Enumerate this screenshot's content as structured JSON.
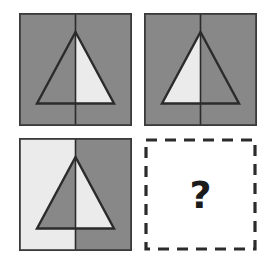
{
  "puzzle": {
    "type": "visual-analogy-matrix",
    "rows": 2,
    "columns": 2,
    "canvas_background": "#ffffff",
    "colors": {
      "gray": "#888888",
      "light": "#ebebeb",
      "outline": "#2b2b2b",
      "dash": "#2b2b2b",
      "question_mark": "#1a1a1a"
    },
    "geometry": {
      "panel_size": 113,
      "apex_x_pct": 50,
      "apex_y_pct": 17,
      "base_left_pct": 16,
      "base_right_pct": 84,
      "base_y_pct": 80
    },
    "cells": [
      {
        "id": "cell-1",
        "position": "top-left",
        "background_left": "#888888",
        "background_right": "#888888",
        "triangle_left": "#888888",
        "triangle_right": "#ebebeb",
        "divider": true,
        "label": "gray square, triangle right half light"
      },
      {
        "id": "cell-2",
        "position": "top-right",
        "background_left": "#888888",
        "background_right": "#888888",
        "triangle_left": "#ebebeb",
        "triangle_right": "#888888",
        "divider": true,
        "label": "gray square, triangle left half light"
      },
      {
        "id": "cell-3",
        "position": "bottom-left",
        "background_left": "#ebebeb",
        "background_right": "#888888",
        "triangle_left": "#888888",
        "triangle_right": "#ebebeb",
        "divider": true,
        "label": "left half light background, triangle halves inverted"
      },
      {
        "id": "cell-4",
        "position": "bottom-right",
        "is_answer_slot": true,
        "border_style": "dashed",
        "question_mark": "?",
        "label": "missing answer placeholder"
      }
    ]
  }
}
